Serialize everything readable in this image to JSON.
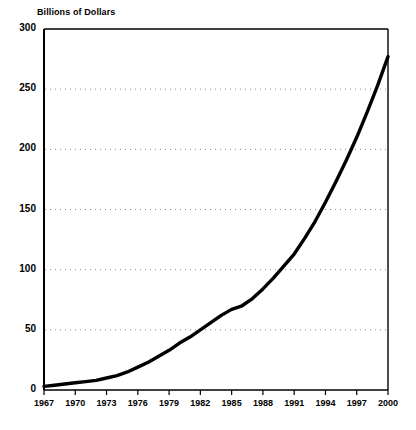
{
  "chart_data": {
    "type": "line",
    "title": "Billions of Dollars",
    "xlabel": "",
    "ylabel": "Billions of Dollars",
    "xlim": [
      1967,
      2000
    ],
    "ylim": [
      0,
      300
    ],
    "grid": "horizontal-dotted",
    "legend": "none",
    "x_tick_labels": [
      "1967",
      "1970",
      "1973",
      "1976",
      "1979",
      "1982",
      "1985",
      "1988",
      "1991",
      "1994",
      "1997",
      "2000"
    ],
    "x_tick_values": [
      1967,
      1970,
      1973,
      1976,
      1979,
      1982,
      1985,
      1988,
      1991,
      1994,
      1997,
      2000
    ],
    "y_tick_labels": [
      "0",
      "50",
      "100",
      "150",
      "200",
      "250",
      "300"
    ],
    "y_tick_values": [
      0,
      50,
      100,
      150,
      200,
      250,
      300
    ],
    "series": [
      {
        "name": "Value",
        "x": [
          1967,
          1968,
          1969,
          1970,
          1971,
          1972,
          1973,
          1974,
          1975,
          1976,
          1977,
          1978,
          1979,
          1980,
          1981,
          1982,
          1983,
          1984,
          1985,
          1986,
          1987,
          1988,
          1989,
          1990,
          1991,
          1992,
          1993,
          1994,
          1995,
          1996,
          1997,
          1998,
          1999,
          2000
        ],
        "values": [
          3,
          4,
          5,
          6,
          7,
          8,
          10,
          12,
          15,
          19,
          23,
          28,
          33,
          39,
          44,
          50,
          56,
          62,
          67,
          70,
          76,
          84,
          93,
          103,
          113,
          126,
          140,
          156,
          173,
          191,
          210,
          231,
          253,
          277
        ]
      }
    ],
    "line_color": "#000000",
    "line_width": 3.4,
    "axis_color": "#000000",
    "grid_color": "#8a8a8a",
    "background_color": "#ffffff"
  },
  "plot_geometry": {
    "left": 44,
    "right": 388,
    "top": 29,
    "bottom": 390
  }
}
